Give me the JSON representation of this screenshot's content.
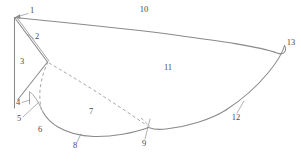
{
  "figure": {
    "type": "patent-line-drawing",
    "caption": "",
    "colors": {
      "outline": "#8a8a8a",
      "dashed": "#a2a2a2",
      "label": "#4a4a4a",
      "leader": "#8e8e8e",
      "background": "#ffffff"
    },
    "labels": [
      {
        "id": "1",
        "text": "1",
        "x": 32,
        "y": 11,
        "role": "leading-edge-apex"
      },
      {
        "id": "2",
        "text": "2",
        "x": 37,
        "y": 37,
        "role": "double-line-edge"
      },
      {
        "id": "3",
        "text": "3",
        "x": 22,
        "y": 62,
        "role": "triangle-interior"
      },
      {
        "id": "4",
        "text": "4",
        "x": 18,
        "y": 103,
        "role": "lower-left-detail"
      },
      {
        "id": "5",
        "text": "5",
        "x": 19,
        "y": 119,
        "role": "lower-arc-detail"
      },
      {
        "id": "6",
        "text": "6",
        "x": 40,
        "y": 130,
        "role": "lower-left-region"
      },
      {
        "id": "7",
        "text": "7",
        "x": 91,
        "y": 112,
        "role": "dashed-interior-region"
      },
      {
        "id": "8",
        "text": "8",
        "x": 75,
        "y": 146,
        "role": "bottom-curve"
      },
      {
        "id": "9",
        "text": "9",
        "x": 144,
        "y": 144,
        "role": "dashed-curve-junction"
      },
      {
        "id": "10",
        "text": "10",
        "x": 144,
        "y": 10,
        "role": "upper-surface"
      },
      {
        "id": "11",
        "text": "11",
        "x": 168,
        "y": 68,
        "role": "main-body-region"
      },
      {
        "id": "12",
        "text": "12",
        "x": 236,
        "y": 118,
        "role": "lower-surface"
      },
      {
        "id": "13",
        "text": "13",
        "x": 291,
        "y": 43,
        "role": "trailing-edge-tip"
      }
    ]
  }
}
